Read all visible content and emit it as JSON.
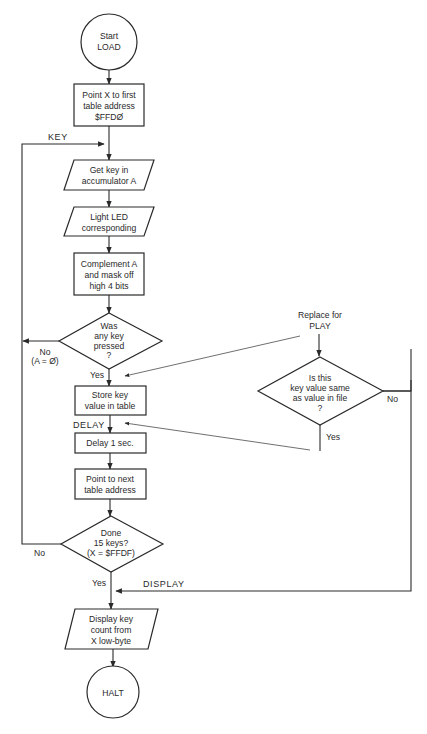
{
  "diagram": {
    "type": "flowchart",
    "nodes": {
      "start": {
        "shape": "circle",
        "lines": [
          "Start",
          "LOAD"
        ]
      },
      "point_first": {
        "shape": "process",
        "lines": [
          "Point X to first",
          "table address",
          "$FFDØ"
        ]
      },
      "get_key": {
        "shape": "io",
        "lines": [
          "Get key in",
          "accumulator A"
        ]
      },
      "light_led": {
        "shape": "io",
        "lines": [
          "Light LED",
          "corresponding"
        ]
      },
      "complement": {
        "shape": "process",
        "lines": [
          "Complement A",
          "and mask off",
          "high 4 bits"
        ]
      },
      "was_pressed": {
        "shape": "decision",
        "lines": [
          "Was",
          "any key",
          "pressed",
          "?"
        ]
      },
      "store_key": {
        "shape": "process",
        "lines": [
          "Store key",
          "value in table"
        ]
      },
      "delay": {
        "shape": "process",
        "lines": [
          "Delay 1 sec."
        ]
      },
      "point_next": {
        "shape": "process",
        "lines": [
          "Point to next",
          "table address"
        ]
      },
      "done": {
        "shape": "decision",
        "lines": [
          "Done",
          "15 keys?",
          "(X = $FFDF)"
        ]
      },
      "display": {
        "shape": "io",
        "lines": [
          "Display key",
          "count from",
          "X low-byte"
        ]
      },
      "halt": {
        "shape": "circle",
        "lines": [
          "HALT"
        ]
      },
      "replace_note": {
        "shape": "annotation",
        "lines": [
          "Replace for",
          "PLAY"
        ]
      },
      "same_value": {
        "shape": "decision",
        "lines": [
          "Is this",
          "key value same",
          "as value in file",
          "?"
        ]
      }
    },
    "edge_labels": {
      "key": "KEY",
      "no_a0_1": "No",
      "no_a0_2": "(A = Ø)",
      "yes_pressed": "Yes",
      "delay": "DELAY",
      "no_done": "No",
      "yes_done": "Yes",
      "display": "DISPLAY",
      "no_same": "No",
      "yes_same": "Yes"
    }
  }
}
